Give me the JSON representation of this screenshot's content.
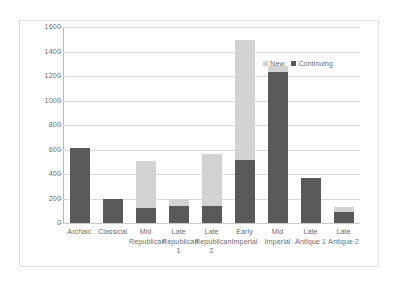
{
  "chart_data": {
    "type": "bar",
    "subtype": "stacked-column",
    "title": "",
    "xlabel": "",
    "ylabel": "",
    "ylim": [
      0,
      1600
    ],
    "y_ticks": [
      0,
      200,
      400,
      600,
      800,
      1000,
      1200,
      1400,
      1600
    ],
    "y_tick_labels": [
      "0",
      "200",
      "400",
      "600",
      "800",
      "1000",
      "1200",
      "1400",
      "1600"
    ],
    "grid": true,
    "legend_position": "top-right",
    "categories": [
      "Archaic",
      "Classical",
      "Mid Republican",
      "Late Republican 1",
      "Late Republican 2",
      "Early Imperial",
      "Mid Imperial",
      "Late Antique 1",
      "Late Antique 2"
    ],
    "category_label_lines": [
      [
        "Archaic"
      ],
      [
        "Classical"
      ],
      [
        "Mid",
        "Republican"
      ],
      [
        "Late",
        "Republican",
        "1"
      ],
      [
        "Late",
        "Republican",
        "2"
      ],
      [
        "Early",
        "Imperial"
      ],
      [
        "Mid",
        "Imperial"
      ],
      [
        "Late",
        "Antique 1"
      ],
      [
        "Late",
        "Antique 2"
      ]
    ],
    "series": [
      {
        "name": "Continuing",
        "color": "#595959",
        "values": [
          615,
          198,
          125,
          138,
          138,
          518,
          1235,
          370,
          92
        ]
      },
      {
        "name": "New",
        "color": "#d3d3d3",
        "values": [
          0,
          0,
          385,
          62,
          422,
          972,
          45,
          0,
          38
        ]
      }
    ],
    "totals": [
      615,
      198,
      510,
      200,
      560,
      1490,
      1280,
      370,
      130
    ]
  },
  "legend": {
    "items": [
      {
        "label": "New",
        "color": "#d3d3d3"
      },
      {
        "label": "Continuing",
        "color": "#595959"
      }
    ]
  },
  "colors": {
    "new": "#d3d3d3",
    "continuing": "#595959",
    "grid": "#d9d9d9",
    "axis": "#b8b8b8",
    "text": "#6e6e6e",
    "frame": "#e2e2e2",
    "background": "#ffffff"
  }
}
